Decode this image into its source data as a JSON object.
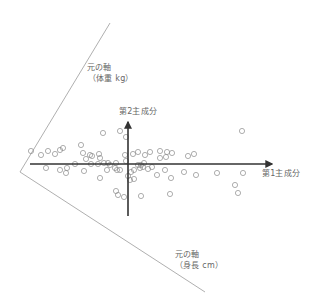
{
  "diagram": {
    "labels": {
      "pc1": "第1主成分",
      "pc2": "第2主成分",
      "weight_axis_line1": "元の軸",
      "weight_axis_line2": "（体重 kg）",
      "height_axis_line1": "元の軸",
      "height_axis_line2": "（身長 cm）"
    },
    "colors": {
      "axis": "#333333",
      "original_axis": "#999999",
      "point": "#8c8c8c",
      "text": "#666666"
    },
    "geometry": {
      "origin": [
        128,
        164
      ],
      "pc1_axis": {
        "x1": 30,
        "y1": 164,
        "x2": 272,
        "y2": 164
      },
      "pc2_axis": {
        "x1": 128,
        "y1": 216,
        "x2": 128,
        "y2": 122
      },
      "weight_axis": {
        "x1": 110,
        "y1": 23,
        "x2": 20,
        "y2": 172
      },
      "height_axis": {
        "x1": 20,
        "y1": 172,
        "x2": 205,
        "y2": 292
      }
    },
    "points": [
      [
        103,
        133
      ],
      [
        120,
        131
      ],
      [
        126,
        137
      ],
      [
        81,
        145
      ],
      [
        63,
        148
      ],
      [
        60,
        150
      ],
      [
        55,
        154
      ],
      [
        48,
        151
      ],
      [
        41,
        155
      ],
      [
        31,
        151
      ],
      [
        83,
        153
      ],
      [
        90,
        155
      ],
      [
        86,
        159
      ],
      [
        92,
        156
      ],
      [
        99,
        154
      ],
      [
        100,
        158
      ],
      [
        125,
        155
      ],
      [
        133,
        154
      ],
      [
        138,
        152
      ],
      [
        145,
        155
      ],
      [
        150,
        152
      ],
      [
        160,
        151
      ],
      [
        160,
        158
      ],
      [
        166,
        157
      ],
      [
        167,
        152
      ],
      [
        172,
        153
      ],
      [
        188,
        156
      ],
      [
        194,
        154
      ],
      [
        242,
        131
      ],
      [
        75,
        164
      ],
      [
        91,
        164
      ],
      [
        98,
        164
      ],
      [
        104,
        163
      ],
      [
        108,
        163
      ],
      [
        110,
        165
      ],
      [
        116,
        163
      ],
      [
        126,
        161
      ],
      [
        141,
        165
      ],
      [
        144,
        163
      ],
      [
        46,
        168
      ],
      [
        60,
        170
      ],
      [
        67,
        168
      ],
      [
        66,
        173
      ],
      [
        84,
        171
      ],
      [
        107,
        170
      ],
      [
        115,
        168
      ],
      [
        117,
        170
      ],
      [
        120,
        170
      ],
      [
        138,
        165
      ],
      [
        140,
        168
      ],
      [
        143,
        167
      ],
      [
        148,
        169
      ],
      [
        152,
        167
      ],
      [
        134,
        170
      ],
      [
        131,
        172
      ],
      [
        128,
        176
      ],
      [
        130,
        180
      ],
      [
        134,
        179
      ],
      [
        157,
        175
      ],
      [
        165,
        170
      ],
      [
        171,
        178
      ],
      [
        184,
        172
      ],
      [
        196,
        175
      ],
      [
        217,
        173
      ],
      [
        243,
        173
      ],
      [
        235,
        185
      ],
      [
        238,
        193
      ],
      [
        170,
        194
      ],
      [
        100,
        178
      ],
      [
        116,
        191
      ],
      [
        118,
        195
      ],
      [
        124,
        197
      ],
      [
        141,
        196
      ]
    ]
  },
  "chart_data": {
    "type": "scatter",
    "title": "",
    "xlabel": "第1主成分",
    "ylabel": "第2主成分",
    "annotations": [
      "元の軸（体重 kg）",
      "元の軸（身長 cm）"
    ],
    "grid": false,
    "legend": null
  }
}
